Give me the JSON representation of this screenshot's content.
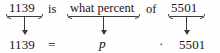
{
  "figure": {
    "kind": "percent-equation-translation-diagram",
    "statement_row": {
      "tokens": [
        {
          "text": "1139",
          "role": "number",
          "style": "roman"
        },
        {
          "text": "is",
          "role": "word",
          "style": "roman"
        },
        {
          "text": "what percent",
          "role": "phrase",
          "style": "roman"
        },
        {
          "text": "of",
          "role": "word",
          "style": "roman"
        },
        {
          "text": "5501",
          "role": "number",
          "style": "roman"
        }
      ]
    },
    "equation_row": {
      "tokens": [
        {
          "text": "1139",
          "role": "number",
          "style": "roman"
        },
        {
          "text": "=",
          "role": "operator",
          "style": "roman"
        },
        {
          "text": "p",
          "role": "variable",
          "style": "italic"
        },
        {
          "text": "·",
          "role": "operator",
          "style": "roman"
        },
        {
          "text": "5501",
          "role": "number",
          "style": "roman"
        }
      ]
    },
    "mappings": [
      {
        "from": "1139",
        "to": "1139"
      },
      {
        "from": "what percent",
        "to": "p"
      },
      {
        "from": "5501",
        "to": "5501"
      }
    ],
    "colors": {
      "background": "#fefefe",
      "text": "#171717",
      "rule": "#3a3a3a"
    }
  }
}
